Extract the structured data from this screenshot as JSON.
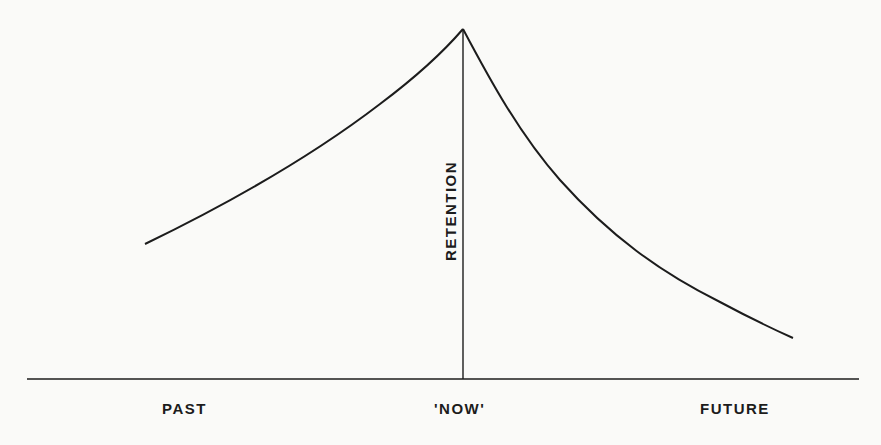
{
  "diagram": {
    "y_axis_label": "RETENTION",
    "x_labels": {
      "past": "PAST",
      "now": "'NOW'",
      "future": "FUTURE"
    },
    "colors": {
      "ink": "#1c1c1c",
      "paper": "#fafaf8"
    },
    "curves": [
      {
        "name": "retrospective",
        "from": "PAST",
        "to": "'NOW'",
        "shape": "rising, concave up"
      },
      {
        "name": "forgetting",
        "from": "'NOW'",
        "to": "FUTURE",
        "shape": "decaying, concave up"
      }
    ]
  }
}
